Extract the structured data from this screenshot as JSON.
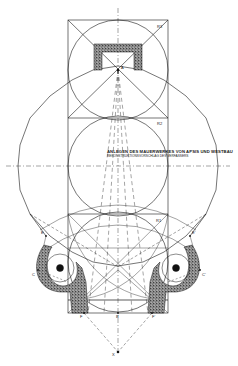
{
  "caption": {
    "title": "ANLEGEN DES MAUERWERKES VON APSIS UND WESTBAU",
    "subtitle": "REKONSTRUKTIONSVORSCHLAG DES VERFASSERS"
  },
  "labels": {
    "r3": "R3",
    "r2": "R2",
    "r1": "R1",
    "a": "A",
    "e": "E",
    "e_prime": "E'",
    "c": "C",
    "c_prime": "C'",
    "f": "F",
    "f_prime": "F'",
    "b": "B",
    "b_prime": "B'",
    "x": "X"
  },
  "colors": {
    "ink": "#1a1a1a",
    "paper": "#ffffff",
    "stipple": "#555555"
  }
}
